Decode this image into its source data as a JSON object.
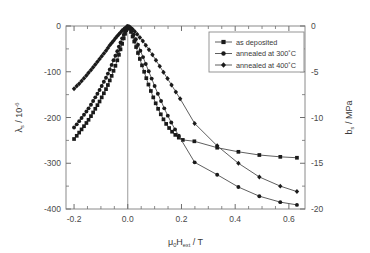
{
  "chart_data": {
    "type": "line",
    "title": "",
    "xlabel": "μ₀H_ext / T",
    "xlabel_parts": {
      "mu": "μ",
      "mu_sub": "0",
      "H": "H",
      "H_sub": "ext",
      "unit": "/ T"
    },
    "ylabel_left": "λ_s / 10⁻⁶",
    "ylabel_left_parts": {
      "lambda": "λ",
      "sub": "s",
      "rest": "/ 10",
      "sup": "-6"
    },
    "ylabel_right": "b_s / MPa",
    "ylabel_right_parts": {
      "b": "b",
      "sub": "s",
      "rest": "/ MPa"
    },
    "xlim": [
      -0.23,
      0.66
    ],
    "ylim_left": [
      -400,
      0
    ],
    "ylim_right": [
      -20,
      0
    ],
    "xticks": [
      -0.2,
      0.0,
      0.2,
      0.4,
      0.6
    ],
    "xticklabels": [
      "-0.2",
      "0.0",
      "0.2",
      "0.4",
      "0.6"
    ],
    "yticks_left": [
      0,
      -100,
      -200,
      -300,
      -400
    ],
    "yticklabels_left": [
      "0",
      "-100",
      "-200",
      "-300",
      "-400"
    ],
    "yticks_right": [
      0,
      -5,
      -10,
      -15,
      -20
    ],
    "yticklabels_right": [
      "0",
      "-5",
      "-10",
      "-15",
      "-20"
    ],
    "minor_ticks": true,
    "grid": false,
    "vertical_reference_line_x": 0.0,
    "legend_position": "top-right",
    "legend_entries": [
      "as deposited",
      "annealed at 300˚C",
      "annealed at 400˚C"
    ],
    "series": [
      {
        "name": "as deposited",
        "marker": "square",
        "color": "#1a1a1a",
        "points": [
          [
            -0.2,
            -247
          ],
          [
            -0.19,
            -240
          ],
          [
            -0.181,
            -233
          ],
          [
            -0.172,
            -226
          ],
          [
            -0.163,
            -219
          ],
          [
            -0.154,
            -212
          ],
          [
            -0.146,
            -205
          ],
          [
            -0.137,
            -197
          ],
          [
            -0.129,
            -189
          ],
          [
            -0.121,
            -181
          ],
          [
            -0.113,
            -173
          ],
          [
            -0.105,
            -165
          ],
          [
            -0.097,
            -156
          ],
          [
            -0.089,
            -147
          ],
          [
            -0.081,
            -138
          ],
          [
            -0.074,
            -129
          ],
          [
            -0.067,
            -119
          ],
          [
            -0.06,
            -109
          ],
          [
            -0.053,
            -98
          ],
          [
            -0.046,
            -87
          ],
          [
            -0.039,
            -75
          ],
          [
            -0.033,
            -63
          ],
          [
            -0.027,
            -51
          ],
          [
            -0.021,
            -39
          ],
          [
            -0.015,
            -27
          ],
          [
            -0.01,
            -17
          ],
          [
            -0.006,
            -9
          ],
          [
            -0.003,
            -4
          ],
          [
            0.0,
            -1
          ],
          [
            0.003,
            -2
          ],
          [
            0.007,
            -6
          ],
          [
            0.012,
            -13
          ],
          [
            0.018,
            -23
          ],
          [
            0.024,
            -34
          ],
          [
            0.031,
            -46
          ],
          [
            0.038,
            -59
          ],
          [
            0.045,
            -72
          ],
          [
            0.053,
            -86
          ],
          [
            0.061,
            -100
          ],
          [
            0.069,
            -114
          ],
          [
            0.077,
            -128
          ],
          [
            0.086,
            -142
          ],
          [
            0.095,
            -156
          ],
          [
            0.104,
            -169
          ],
          [
            0.113,
            -181
          ],
          [
            0.123,
            -193
          ],
          [
            0.133,
            -204
          ],
          [
            0.143,
            -214
          ],
          [
            0.154,
            -223
          ],
          [
            0.165,
            -231
          ],
          [
            0.177,
            -238
          ],
          [
            0.19,
            -244
          ],
          [
            0.205,
            -249
          ],
          [
            0.248,
            -252
          ],
          [
            0.333,
            -266
          ],
          [
            0.412,
            -275
          ],
          [
            0.49,
            -282
          ],
          [
            0.568,
            -286
          ],
          [
            0.63,
            -288
          ]
        ]
      },
      {
        "name": "annealed at 300˚C",
        "marker": "circle",
        "color": "#1a1a1a",
        "points": [
          [
            -0.2,
            -222
          ],
          [
            -0.19,
            -215
          ],
          [
            -0.181,
            -208
          ],
          [
            -0.172,
            -201
          ],
          [
            -0.163,
            -194
          ],
          [
            -0.154,
            -187
          ],
          [
            -0.146,
            -180
          ],
          [
            -0.137,
            -172
          ],
          [
            -0.129,
            -164
          ],
          [
            -0.121,
            -156
          ],
          [
            -0.113,
            -148
          ],
          [
            -0.105,
            -140
          ],
          [
            -0.097,
            -131
          ],
          [
            -0.089,
            -122
          ],
          [
            -0.081,
            -113
          ],
          [
            -0.074,
            -104
          ],
          [
            -0.067,
            -95
          ],
          [
            -0.06,
            -85
          ],
          [
            -0.053,
            -75
          ],
          [
            -0.046,
            -65
          ],
          [
            -0.039,
            -55
          ],
          [
            -0.033,
            -45
          ],
          [
            -0.027,
            -36
          ],
          [
            -0.021,
            -27
          ],
          [
            -0.015,
            -19
          ],
          [
            -0.01,
            -12
          ],
          [
            -0.006,
            -7
          ],
          [
            -0.003,
            -3
          ],
          [
            0.0,
            -1
          ],
          [
            0.004,
            -2
          ],
          [
            0.009,
            -5
          ],
          [
            0.015,
            -11
          ],
          [
            0.022,
            -19
          ],
          [
            0.03,
            -29
          ],
          [
            0.038,
            -41
          ],
          [
            0.047,
            -54
          ],
          [
            0.057,
            -68
          ],
          [
            0.067,
            -83
          ],
          [
            0.078,
            -99
          ],
          [
            0.089,
            -115
          ],
          [
            0.1,
            -131
          ],
          [
            0.112,
            -148
          ],
          [
            0.124,
            -164
          ],
          [
            0.136,
            -180
          ],
          [
            0.149,
            -196
          ],
          [
            0.162,
            -211
          ],
          [
            0.176,
            -226
          ],
          [
            0.19,
            -240
          ],
          [
            0.249,
            -298
          ],
          [
            0.333,
            -325
          ],
          [
            0.412,
            -352
          ],
          [
            0.49,
            -372
          ],
          [
            0.568,
            -385
          ],
          [
            0.63,
            -391
          ]
        ]
      },
      {
        "name": "annealed at 400˚C",
        "marker": "diamond",
        "color": "#1a1a1a",
        "points": [
          [
            -0.2,
            -137
          ],
          [
            -0.19,
            -131
          ],
          [
            -0.181,
            -126
          ],
          [
            -0.172,
            -120
          ],
          [
            -0.163,
            -114
          ],
          [
            -0.154,
            -108
          ],
          [
            -0.146,
            -102
          ],
          [
            -0.137,
            -96
          ],
          [
            -0.129,
            -90
          ],
          [
            -0.121,
            -84
          ],
          [
            -0.113,
            -78
          ],
          [
            -0.105,
            -72
          ],
          [
            -0.097,
            -66
          ],
          [
            -0.089,
            -60
          ],
          [
            -0.081,
            -54
          ],
          [
            -0.074,
            -48
          ],
          [
            -0.067,
            -42
          ],
          [
            -0.06,
            -37
          ],
          [
            -0.053,
            -32
          ],
          [
            -0.046,
            -27
          ],
          [
            -0.039,
            -22
          ],
          [
            -0.033,
            -18
          ],
          [
            -0.027,
            -14
          ],
          [
            -0.021,
            -10
          ],
          [
            -0.015,
            -7
          ],
          [
            -0.01,
            -5
          ],
          [
            -0.006,
            -3
          ],
          [
            -0.003,
            -2
          ],
          [
            0.0,
            -1
          ],
          [
            0.005,
            -2
          ],
          [
            0.011,
            -4
          ],
          [
            0.018,
            -7
          ],
          [
            0.026,
            -12
          ],
          [
            0.035,
            -18
          ],
          [
            0.045,
            -25
          ],
          [
            0.056,
            -33
          ],
          [
            0.067,
            -42
          ],
          [
            0.079,
            -52
          ],
          [
            0.092,
            -63
          ],
          [
            0.105,
            -75
          ],
          [
            0.119,
            -88
          ],
          [
            0.133,
            -101
          ],
          [
            0.148,
            -115
          ],
          [
            0.163,
            -129
          ],
          [
            0.179,
            -144
          ],
          [
            0.195,
            -159
          ],
          [
            0.249,
            -213
          ],
          [
            0.333,
            -262
          ],
          [
            0.412,
            -300
          ],
          [
            0.49,
            -330
          ],
          [
            0.568,
            -350
          ],
          [
            0.63,
            -362
          ]
        ]
      }
    ]
  }
}
